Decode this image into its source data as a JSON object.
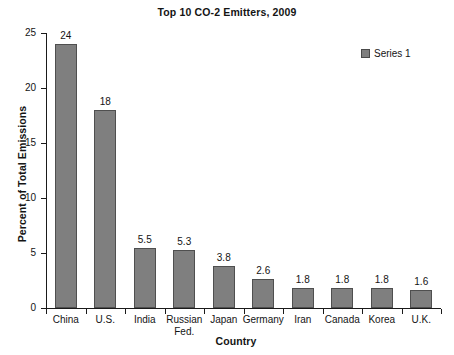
{
  "chart_data": {
    "type": "bar",
    "title": "Top 10 CO-2 Emitters, 2009",
    "xlabel": "Country",
    "ylabel": "Percent of Total Emissions",
    "categories": [
      "China",
      "U.S.",
      "India",
      "Russian\nFed.",
      "Japan",
      "Germany",
      "Iran",
      "Canada",
      "Korea",
      "U.K."
    ],
    "values": [
      24,
      18,
      5.5,
      5.3,
      3.8,
      2.6,
      1.8,
      1.8,
      1.8,
      1.6
    ],
    "value_labels": [
      "24",
      "18",
      "5.5",
      "5.3",
      "3.8",
      "2.6",
      "1.8",
      "1.8",
      "1.8",
      "1.6"
    ],
    "series": [
      {
        "name": "Series 1",
        "values": [
          24,
          18,
          5.5,
          5.3,
          3.8,
          2.6,
          1.8,
          1.8,
          1.8,
          1.6
        ],
        "color": "#7f7f7f"
      }
    ],
    "ylim": [
      0,
      25
    ],
    "y_ticks": [
      0,
      5,
      10,
      15,
      20,
      25
    ],
    "y_tick_labels": [
      "0",
      "5",
      "10",
      "15",
      "20",
      "25"
    ],
    "grid": false,
    "legend_position": "top-right",
    "bar_color": "#7f7f7f",
    "bar_border_color": "#4f4f4f",
    "axis_color": "#1a1a1a",
    "background": "#ffffff"
  },
  "legend": {
    "entries": [
      {
        "label": "Series 1",
        "color": "#7f7f7f"
      }
    ]
  }
}
